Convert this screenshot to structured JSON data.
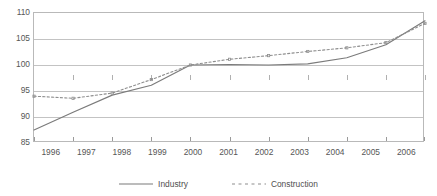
{
  "chart_data": {
    "type": "line",
    "title": "Employment index, manufacturing industry and construction (2000 = 100)",
    "xlabel": "",
    "ylabel": "",
    "x": [
      1996,
      1997,
      1998,
      1999,
      2000,
      2001,
      2002,
      2003,
      2004,
      2005,
      2006
    ],
    "categories": [
      "1996",
      "1997",
      "1998",
      "1999",
      "2000",
      "2001",
      "2002",
      "2003",
      "2004",
      "2005",
      "2006"
    ],
    "xlim": [
      1996,
      2006
    ],
    "ylim": [
      85,
      110
    ],
    "yticks": [
      85,
      90,
      95,
      100,
      105,
      110
    ],
    "ytick_labels": [
      "85",
      "90",
      "95",
      "100",
      "105",
      "110"
    ],
    "grid": true,
    "legend_position": "bottom-center",
    "series": [
      {
        "name": "Industry",
        "style": "solid",
        "color": "#7b7b7b",
        "markers": false,
        "values": [
          87.5,
          90.9,
          94.2,
          96.1,
          100.0,
          100.1,
          100.0,
          100.2,
          101.4,
          103.9,
          108.5
        ]
      },
      {
        "name": "Construction",
        "style": "dotted",
        "color": "#8e8e8e",
        "markers": true,
        "values": [
          94.0,
          93.6,
          94.6,
          97.2,
          100.0,
          101.1,
          101.8,
          102.6,
          103.3,
          104.3,
          108.0
        ]
      }
    ]
  },
  "legend": {
    "entries": [
      {
        "label": "Industry",
        "style": "solid"
      },
      {
        "label": "Construction",
        "style": "dotted"
      }
    ]
  }
}
